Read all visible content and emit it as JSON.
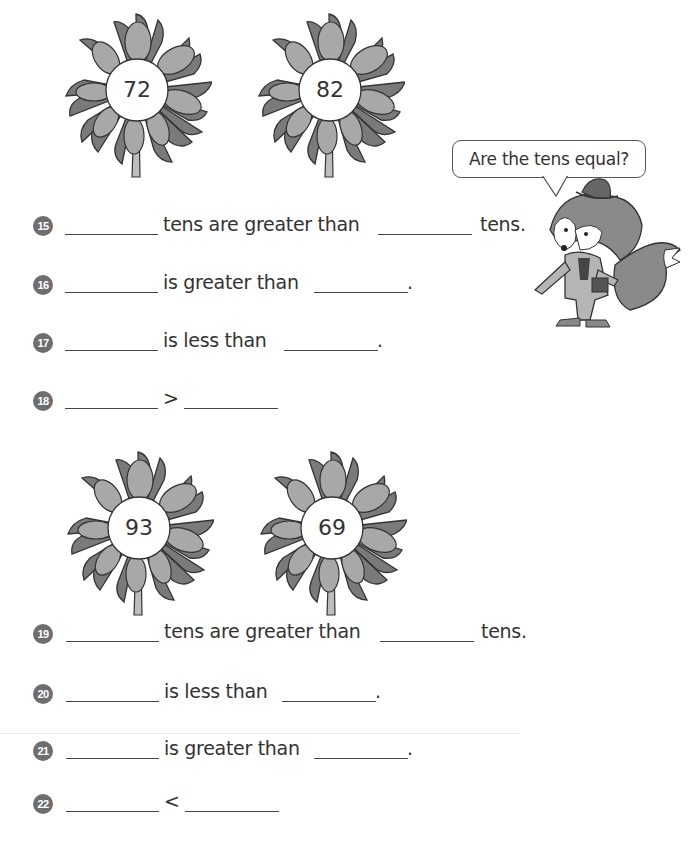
{
  "flowers": [
    {
      "value": "72"
    },
    {
      "value": "82"
    },
    {
      "value": "93"
    },
    {
      "value": "69"
    }
  ],
  "speech_bubble": {
    "text": "Are the tens equal?"
  },
  "questions": [
    {
      "number": "15",
      "text_1": "tens are greater than",
      "text_2": "tens."
    },
    {
      "number": "16",
      "text_1": "is greater than",
      "text_2": "."
    },
    {
      "number": "17",
      "text_1": "is less than",
      "text_2": "."
    },
    {
      "number": "18",
      "text_1": ">"
    },
    {
      "number": "19",
      "text_1": "tens are greater than",
      "text_2": "tens."
    },
    {
      "number": "20",
      "text_1": "is less than",
      "text_2": "."
    },
    {
      "number": "21",
      "text_1": "is greater than",
      "text_2": "."
    },
    {
      "number": "22",
      "text_1": "<"
    }
  ],
  "colors": {
    "petal_dark": "#7a7a7a",
    "petal_light": "#a8a8a8",
    "outline": "#333333",
    "badge": "#6e6e6e"
  }
}
